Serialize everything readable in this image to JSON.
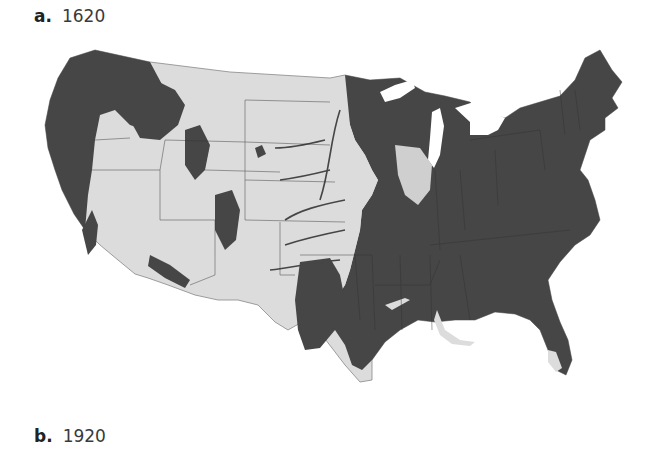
{
  "figure": {
    "panels": [
      {
        "letter": "a.",
        "year": "1620"
      },
      {
        "letter": "b.",
        "year": "1920"
      }
    ]
  },
  "map": {
    "subject": "Contiguous United States forest cover",
    "year_shown": "1620",
    "colors": {
      "forest": "#464646",
      "non_forest_land": "#dcdcdc",
      "water_background": "#ffffff",
      "state_borders": "#555555"
    },
    "legend": []
  }
}
